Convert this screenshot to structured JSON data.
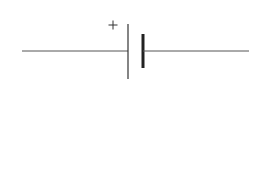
{
  "diagram": {
    "type": "circuit-symbol",
    "component": "cell",
    "polarity_label": "+",
    "colors": {
      "stroke": "#444444",
      "background": "#ffffff"
    },
    "wire_left": {
      "x1": 22,
      "y1": 51,
      "x2": 128,
      "y2": 51
    },
    "positive_plate": {
      "x": 128,
      "y1": 24,
      "y2": 79
    },
    "negative_plate": {
      "x": 143,
      "y1": 34,
      "y2": 68
    },
    "wire_right": {
      "x1": 143,
      "y1": 51,
      "x2": 249,
      "y2": 51
    },
    "plus_position": {
      "x": 113,
      "y": 25
    }
  }
}
